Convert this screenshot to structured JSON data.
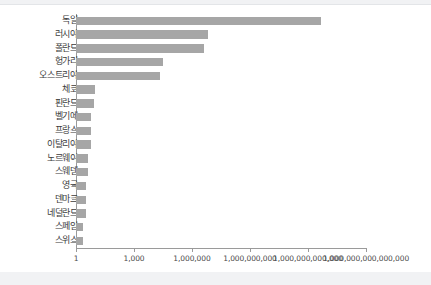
{
  "chart_data": {
    "type": "bar",
    "orientation": "horizontal",
    "title": "",
    "subtitle": "",
    "xlabel": "",
    "ylabel": "",
    "xscale": "log",
    "xlim": [
      1,
      1000000000000000
    ],
    "grid": false,
    "legend": null,
    "legend_position": "none",
    "bar_color": "#a6a6a6",
    "axis_color": "#9a9a9a",
    "xticks": [
      1,
      1000,
      1000000,
      1000000000,
      1000000000000,
      1000000000000000
    ],
    "xtick_labels": [
      "1",
      "1,000",
      "1,000,000",
      "1,000,000,000",
      "1,000,000,000,000",
      "1,000,000,000,000,000"
    ],
    "categories": [
      "독일",
      "러시아",
      "폴란드",
      "헝가리",
      "오스트리아",
      "체코",
      "핀란드",
      "벨기에",
      "프랑스",
      "이탈리아",
      "노르웨이",
      "스웨덴",
      "영국",
      "덴마크",
      "네덜란드",
      "스페인",
      "스위스"
    ],
    "values": [
      15000000000000.0,
      150000000.0,
      30000000.0,
      100000.0,
      50000.0,
      6300,
      4000,
      1300,
      1300,
      1300,
      630,
      630,
      400,
      400,
      400,
      200,
      200
    ],
    "bar_pixel_ends": [
      321,
      208,
      204,
      163,
      160,
      95,
      94,
      91,
      91,
      91,
      88,
      88,
      86,
      86,
      86,
      83,
      83
    ]
  },
  "page": {
    "background": "#ffffff",
    "band_color": "#f1f2f4"
  }
}
